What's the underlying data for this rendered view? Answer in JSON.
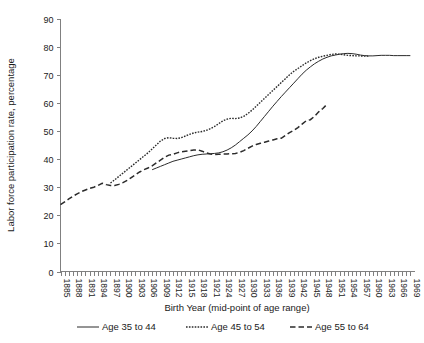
{
  "chart_data": {
    "type": "line",
    "title": "",
    "xlabel": "Birth Year (mid-point of age range)",
    "ylabel": "Labor force participation rate, percentage",
    "ylim": [
      0,
      90
    ],
    "ytick_step": 10,
    "yticks": [
      "0",
      "10",
      "20",
      "30",
      "40",
      "50",
      "60",
      "70",
      "80",
      "90"
    ],
    "xlim": [
      1885,
      1970
    ],
    "xtick_step": 3,
    "xtick_minor_step": 1,
    "xticks": [
      "1885",
      "1888",
      "1891",
      "1894",
      "1897",
      "1900",
      "1903",
      "1906",
      "1909",
      "1912",
      "1915",
      "1918",
      "1921",
      "1924",
      "1927",
      "1930",
      "1933",
      "1936",
      "1939",
      "1942",
      "1945",
      "1948",
      "1951",
      "1954",
      "1957",
      "1960",
      "1963",
      "1966",
      "1969"
    ],
    "grid": false,
    "legend_position": "bottom",
    "series": [
      {
        "name": "Age 35 to 44",
        "style": "solid",
        "color": "#2b2b2b",
        "x": [
          1907,
          1908,
          1909,
          1910,
          1911,
          1912,
          1913,
          1914,
          1915,
          1916,
          1917,
          1918,
          1919,
          1920,
          1921,
          1922,
          1923,
          1924,
          1925,
          1926,
          1927,
          1928,
          1929,
          1930,
          1931,
          1932,
          1933,
          1934,
          1935,
          1936,
          1937,
          1938,
          1939,
          1940,
          1941,
          1942,
          1943,
          1944,
          1945,
          1946,
          1947,
          1948,
          1949,
          1950,
          1951,
          1952,
          1953,
          1954,
          1955,
          1956,
          1957,
          1958,
          1959,
          1960,
          1961,
          1962,
          1963,
          1964,
          1965,
          1966,
          1967,
          1968,
          1969
        ],
        "y": [
          36.2,
          36.8,
          37.4,
          38.0,
          38.6,
          39.2,
          39.6,
          40.0,
          40.4,
          40.8,
          41.2,
          41.5,
          41.7,
          41.8,
          41.9,
          42.0,
          42.2,
          42.6,
          43.2,
          44.0,
          45.0,
          46.2,
          47.4,
          48.6,
          50.0,
          51.6,
          53.4,
          55.2,
          57.0,
          58.8,
          60.5,
          62.2,
          63.8,
          65.4,
          67.0,
          68.6,
          70.2,
          71.6,
          72.8,
          73.9,
          74.8,
          75.6,
          76.2,
          76.7,
          77.0,
          77.3,
          77.5,
          77.6,
          77.5,
          77.3,
          77.0,
          76.8,
          76.7,
          76.7,
          76.8,
          76.9,
          76.9,
          76.9,
          76.8,
          76.8,
          76.8,
          76.8,
          76.8
        ]
      },
      {
        "name": "Age 45 to 54",
        "style": "dotted",
        "color": "#2b2b2b",
        "x": [
          1897,
          1898,
          1899,
          1900,
          1901,
          1902,
          1903,
          1904,
          1905,
          1906,
          1907,
          1908,
          1909,
          1910,
          1911,
          1912,
          1913,
          1914,
          1915,
          1916,
          1917,
          1918,
          1919,
          1920,
          1921,
          1922,
          1923,
          1924,
          1925,
          1926,
          1927,
          1928,
          1929,
          1930,
          1931,
          1932,
          1933,
          1934,
          1935,
          1936,
          1937,
          1938,
          1939,
          1940,
          1941,
          1942,
          1943,
          1944,
          1945,
          1946,
          1947,
          1948,
          1949,
          1950,
          1951,
          1952,
          1953,
          1954,
          1955,
          1956,
          1957,
          1958,
          1959
        ],
        "y": [
          31.5,
          32.6,
          33.8,
          35.0,
          36.2,
          37.4,
          38.6,
          39.8,
          41.0,
          42.2,
          43.6,
          45.0,
          46.4,
          47.3,
          47.6,
          47.4,
          47.3,
          47.6,
          48.2,
          48.8,
          49.3,
          49.6,
          49.8,
          50.2,
          50.8,
          51.6,
          52.6,
          53.6,
          54.2,
          54.5,
          54.4,
          54.6,
          55.2,
          56.2,
          57.4,
          58.8,
          60.2,
          61.6,
          63.0,
          64.4,
          65.8,
          67.2,
          68.6,
          70.0,
          71.2,
          72.2,
          73.2,
          74.2,
          75.0,
          75.7,
          76.2,
          76.6,
          76.9,
          77.2,
          77.4,
          77.3,
          77.1,
          76.9,
          76.8,
          76.7,
          76.7,
          76.6,
          76.6
        ]
      },
      {
        "name": "Age 55 to 64",
        "style": "dashed",
        "color": "#2b2b2b",
        "x": [
          1885,
          1886,
          1887,
          1888,
          1889,
          1890,
          1891,
          1892,
          1893,
          1894,
          1895,
          1896,
          1897,
          1898,
          1899,
          1900,
          1901,
          1902,
          1903,
          1904,
          1905,
          1906,
          1907,
          1908,
          1909,
          1910,
          1911,
          1912,
          1913,
          1914,
          1915,
          1916,
          1917,
          1918,
          1919,
          1920,
          1921,
          1922,
          1923,
          1924,
          1925,
          1926,
          1927,
          1928,
          1929,
          1930,
          1931,
          1932,
          1933,
          1934,
          1935,
          1936,
          1937,
          1938,
          1939,
          1940,
          1941,
          1942,
          1943,
          1944,
          1945,
          1946,
          1947,
          1948,
          1949
        ],
        "y": [
          23.8,
          24.8,
          25.8,
          26.8,
          27.6,
          28.4,
          29.0,
          29.6,
          30.0,
          30.6,
          31.4,
          30.9,
          30.6,
          30.6,
          31.0,
          31.6,
          32.4,
          33.4,
          34.4,
          35.4,
          36.2,
          36.8,
          37.6,
          38.6,
          39.6,
          40.6,
          41.4,
          41.7,
          42.2,
          42.6,
          42.8,
          43.0,
          43.2,
          43.3,
          42.8,
          42.2,
          41.8,
          41.6,
          41.7,
          41.8,
          41.8,
          41.9,
          42.0,
          42.4,
          43.0,
          43.8,
          44.6,
          45.2,
          45.6,
          46.0,
          46.4,
          46.8,
          47.2,
          47.4,
          48.4,
          49.4,
          50.2,
          51.2,
          52.4,
          53.6,
          54.0,
          55.2,
          56.8,
          58.0,
          59.5
        ]
      }
    ]
  },
  "legend": {
    "items": [
      {
        "label": "Age 35 to 44",
        "style": "solid"
      },
      {
        "label": "Age 45 to 54",
        "style": "dotted"
      },
      {
        "label": "Age 55 to 64",
        "style": "dashed"
      }
    ]
  }
}
